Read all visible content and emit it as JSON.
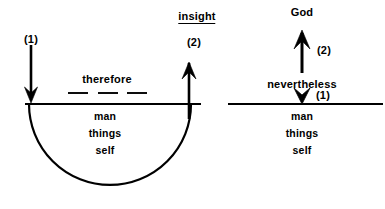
{
  "figure": {
    "stroke_color": "#000000",
    "background_color": "#ffffff"
  },
  "left_diagram": {
    "name": "immanent-circular-diagram",
    "down_arrow_label": "(1)",
    "middle_word": "therefore",
    "dash_count": 3,
    "up_arrow_label": "(2)",
    "up_arrow_heading": "insight",
    "heading_underlined": true,
    "below_line_terms": [
      "man",
      "things",
      "self"
    ],
    "has_semicircle_arc": true
  },
  "right_diagram": {
    "name": "transcendent-revelation-diagram",
    "top_term": "God",
    "up_arrow_label": "(2)",
    "middle_word": "nevertheless",
    "down_arrow_label": "(1)",
    "below_line_terms": [
      "man",
      "things",
      "self"
    ],
    "has_semicircle_arc": false
  }
}
